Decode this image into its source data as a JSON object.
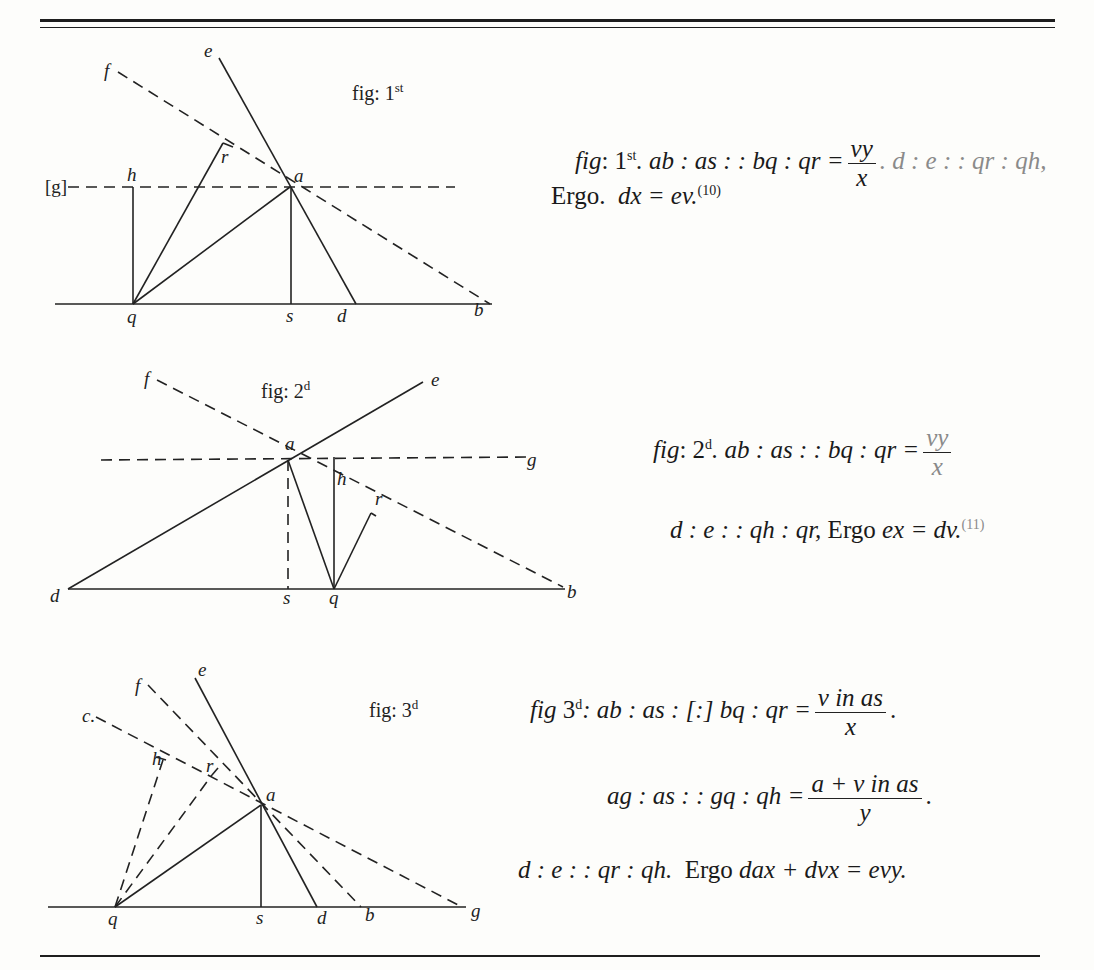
{
  "page": {
    "top_rule": "double-rule",
    "bottom_rule": "single-rule"
  },
  "figures": [
    {
      "caption": "fig: 1st",
      "caption_main": "fig: 1",
      "caption_sup": "st",
      "points": [
        "e",
        "f",
        "r",
        "[g]",
        "h",
        "a",
        "q",
        "s",
        "d",
        "b"
      ],
      "labels": {
        "e": "e",
        "f": "f",
        "r": "r",
        "g": "[g]",
        "h": "h",
        "a": "a",
        "q": "q",
        "s": "s",
        "d": "d",
        "b": "b"
      }
    },
    {
      "caption": "fig: 2d",
      "caption_main": "fig: 2",
      "caption_sup": "d",
      "points": [
        "f",
        "e",
        "a",
        "g",
        "h",
        "r",
        "d",
        "s",
        "q",
        "b"
      ],
      "labels": {
        "f": "f",
        "e": "e",
        "a": "a",
        "g": "g",
        "h": "h",
        "r": "r",
        "d": "d",
        "s": "s",
        "q": "q",
        "b": "b"
      }
    },
    {
      "caption": "fig: 3d",
      "caption_main": "fig: 3",
      "caption_sup": "d",
      "points": [
        "e",
        "f",
        "c",
        "h",
        "r",
        "a",
        "q",
        "s",
        "d",
        "b",
        "g"
      ],
      "labels": {
        "e": "e",
        "f": "f",
        "c": "c.",
        "h": "h",
        "r": "r",
        "a": "a",
        "q": "q",
        "s": "s",
        "d": "d",
        "b": "b",
        "g": "g"
      }
    }
  ],
  "equations": {
    "fig1": {
      "line1_prefix": "fig",
      "line1_label": ": 1",
      "line1_sup": "st",
      "line1_ratio": ". ab : as : : bq : qr =",
      "line1_num": "vy",
      "line1_den": "x",
      "line1_tail": ". d : e : : qr : qh,",
      "line2_word": "Ergo.",
      "line2_expr": "dx = ev.",
      "line2_note": "(10)"
    },
    "fig2": {
      "line1_prefix": "fig",
      "line1_label": ": 2",
      "line1_sup": "d",
      "line1_ratio": ". ab : as : : bq : qr =",
      "line1_num": "vy",
      "line1_den": "x",
      "line2_expr": "d : e : : qh : qr,",
      "line2_word": "Ergo",
      "line2_result": "ex = dv.",
      "line2_note": "(11)"
    },
    "fig3": {
      "line1_prefix": "fig",
      "line1_label": " 3",
      "line1_sup": "d",
      "line1_ratio": ": ab : as : [:] bq : qr =",
      "line1_num": "v in as",
      "line1_den": "x",
      "line2_ratio": "ag : as : : gq : qh =",
      "line2_num": "a + v in as",
      "line2_den": "y",
      "line3_expr": "d : e : : qr : qh.",
      "line3_word": "Ergo",
      "line3_result": "dax + dvx = evy."
    }
  }
}
